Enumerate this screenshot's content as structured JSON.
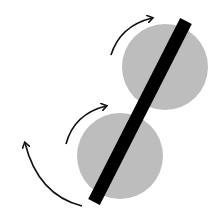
{
  "diagram": {
    "colors": {
      "background": "#ffffff",
      "disk": "#bdbdbd",
      "bar": "#000000",
      "arrow": "#111111"
    },
    "disks": [
      {
        "name": "top-disk",
        "cx": 165,
        "cy": 67,
        "r": 43
      },
      {
        "name": "bottom-disk",
        "cx": 120,
        "cy": 156,
        "r": 43
      }
    ],
    "bar": {
      "x1": 186,
      "y1": 21,
      "x2": 94,
      "y2": 202,
      "width": 13
    },
    "arrows": [
      {
        "name": "top-rotation-arrow",
        "path": "M111,55 Q120,26 152,18",
        "tip": [
          152,
          18
        ]
      },
      {
        "name": "middle-rotation-arrow",
        "path": "M66,144 Q74,114 106,106",
        "tip": [
          106,
          106
        ]
      },
      {
        "name": "outer-rotation-arrow",
        "path": "M82,206 Q38,195 25,143",
        "tip": [
          25,
          143
        ]
      }
    ]
  }
}
